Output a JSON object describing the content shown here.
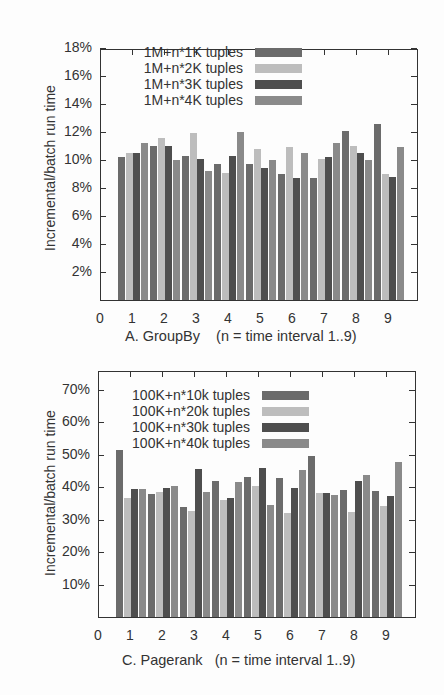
{
  "chart_data": [
    {
      "type": "bar",
      "title": "A. GroupBy    (n = time interval 1..9)",
      "xlabel": "",
      "ylabel": "Incremental/batch run time",
      "categories": [
        "1",
        "2",
        "3",
        "4",
        "5",
        "6",
        "7",
        "8",
        "9"
      ],
      "x_ticks": [
        "0",
        "1",
        "2",
        "3",
        "4",
        "5",
        "6",
        "7",
        "8",
        "9"
      ],
      "y_ticks": [
        "2%",
        "4%",
        "6%",
        "8%",
        "10%",
        "12%",
        "14%",
        "16%",
        "18%"
      ],
      "ylim": [
        0,
        18
      ],
      "legend_position": "upper-center",
      "grid": false,
      "series": [
        {
          "name": "1M+n*1K tuples",
          "color": "#6b6b6b",
          "values": [
            10.2,
            11.0,
            10.3,
            9.7,
            9.7,
            9.0,
            8.7,
            12.1,
            12.6
          ]
        },
        {
          "name": "1M+n*2K tuples",
          "color": "#bdbdbd",
          "values": [
            10.5,
            11.6,
            11.9,
            9.1,
            10.8,
            10.9,
            10.1,
            11.0,
            9.0
          ]
        },
        {
          "name": "1M+n*3K tuples",
          "color": "#4e4e4e",
          "values": [
            10.5,
            11.0,
            10.1,
            10.3,
            9.4,
            8.7,
            10.2,
            10.5,
            8.8
          ]
        },
        {
          "name": "1M+n*4K tuples",
          "color": "#8a8a8a",
          "values": [
            11.2,
            10.0,
            9.2,
            12.0,
            10.0,
            10.5,
            11.2,
            10.0,
            10.9
          ]
        }
      ]
    },
    {
      "type": "bar",
      "title": "C. Pagerank   (n = time interval 1..9)",
      "xlabel": "",
      "ylabel": "Incremental/batch run time",
      "categories": [
        "1",
        "2",
        "3",
        "4",
        "5",
        "6",
        "7",
        "8",
        "9"
      ],
      "x_ticks": [
        "0",
        "1",
        "2",
        "3",
        "4",
        "5",
        "6",
        "7",
        "8",
        "9"
      ],
      "y_ticks": [
        "10%",
        "20%",
        "30%",
        "40%",
        "50%",
        "60%",
        "70%"
      ],
      "ylim": [
        0,
        75
      ],
      "legend_position": "upper-center",
      "grid": false,
      "series": [
        {
          "name": "100K+n*10k tuples",
          "color": "#6b6b6b",
          "values": [
            51.5,
            38.0,
            34.0,
            41.8,
            43.0,
            42.8,
            49.5,
            39.0,
            38.8
          ]
        },
        {
          "name": "100K+n*20k tuples",
          "color": "#bdbdbd",
          "values": [
            36.5,
            38.6,
            32.5,
            36.0,
            40.3,
            32.0,
            38.2,
            32.3,
            34.2
          ]
        },
        {
          "name": "100K+n*30k tuples",
          "color": "#4e4e4e",
          "values": [
            39.3,
            39.8,
            45.4,
            36.6,
            45.7,
            39.7,
            38.2,
            41.8,
            37.2
          ]
        },
        {
          "name": "100K+n*40k tuples",
          "color": "#8a8a8a",
          "values": [
            39.3,
            40.2,
            38.4,
            41.5,
            34.5,
            45.2,
            37.5,
            43.7,
            47.7
          ]
        }
      ]
    }
  ]
}
